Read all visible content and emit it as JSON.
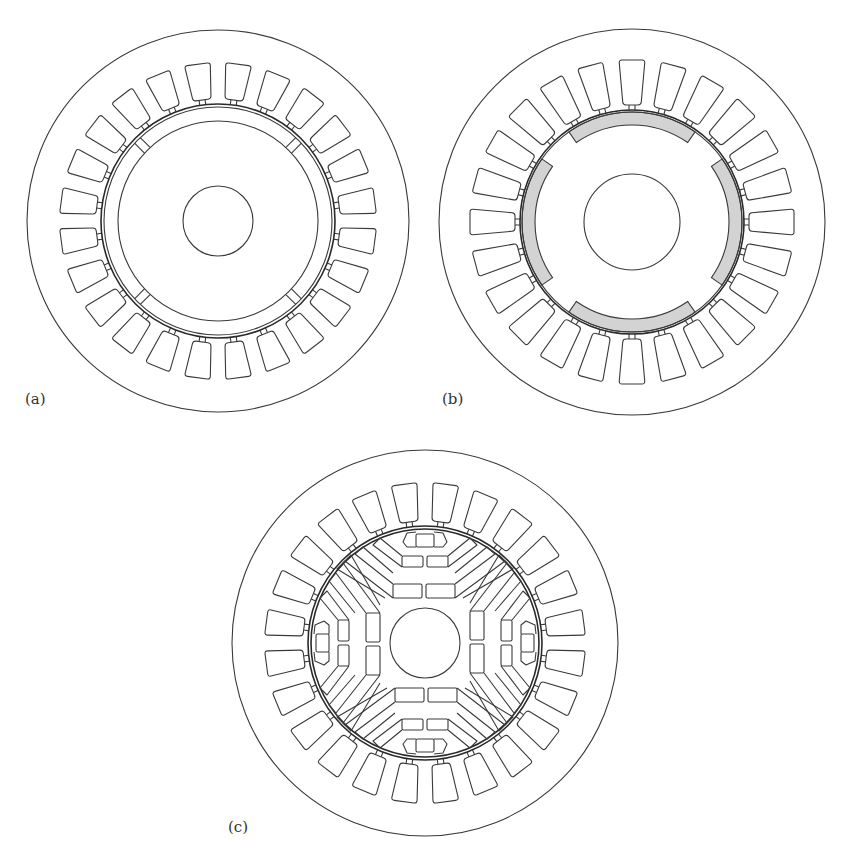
{
  "figure": {
    "panels": [
      {
        "id": "a",
        "label": "(a)",
        "description": "Surface-inset PM rotor inside 24-slot stator",
        "stator_slots": 24,
        "slot_offset_deg": 7.5,
        "rotor_type": "inset-ring",
        "magnet_fill": null
      },
      {
        "id": "b",
        "label": "(b)",
        "description": "Surface-mounted PM rotor inside 24-slot stator",
        "stator_slots": 24,
        "slot_offset_deg": 0,
        "rotor_type": "surface-mounted",
        "magnet_count": 4,
        "magnet_fill": "#d3d3d3"
      },
      {
        "id": "c",
        "label": "(c)",
        "description": "Multi-layer interior PM rotor inside 24-slot stator",
        "stator_slots": 24,
        "slot_offset_deg": 7.5,
        "rotor_type": "multi-layer-interior",
        "poles": 4,
        "barrier_layers": 3,
        "magnet_fill": null
      }
    ],
    "colors": {
      "stroke": "#3a3a3a",
      "background": "#ffffff",
      "magnet": "#d3d3d3"
    }
  }
}
